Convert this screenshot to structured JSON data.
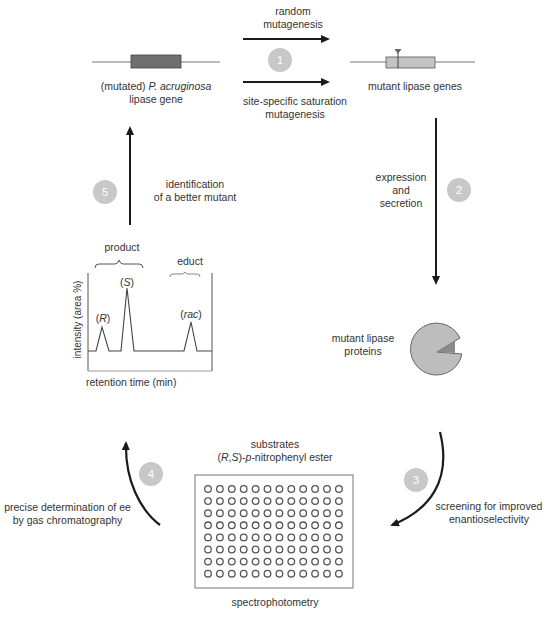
{
  "figure": {
    "type": "directed-evolution-cycle",
    "nodes": {
      "wildtype_gene": {
        "label_prefix": "(mutated) ",
        "label_species": "P. acruginosa",
        "label_line2": "lipase gene"
      },
      "mutant_genes": {
        "label": "mutant lipase genes"
      },
      "mutant_proteins": {
        "label_line1": "mutant lipase",
        "label_line2": "proteins"
      },
      "plate": {
        "title_line1": "substrates",
        "title_line2_parts": [
          "(",
          "R",
          ",",
          "S",
          ")-",
          "p",
          "-nitrophenyl ester"
        ],
        "caption": "spectrophotometry",
        "rows": 8,
        "cols": 12
      },
      "chromatogram": {
        "ylabel": "intensity (area %)",
        "xlabel": "retention time (min)",
        "group_product": "product",
        "group_educt": "educt",
        "peaks": [
          {
            "label": "R",
            "height": 0.35
          },
          {
            "label": "S",
            "height": 0.8
          },
          {
            "label": "rac",
            "height": 0.45
          }
        ]
      }
    },
    "steps": [
      {
        "number": "1",
        "label_top_line1": "random",
        "label_top_line2": "mutagenesis",
        "label_bottom_line1": "site-specific saturation",
        "label_bottom_line2": "mutagenesis"
      },
      {
        "number": "2",
        "label_line1": "expression",
        "label_line2": "and",
        "label_line3": "secretion"
      },
      {
        "number": "3",
        "label_line1": "screening for improved",
        "label_line2": "enantioselectivity"
      },
      {
        "number": "4",
        "label_line1": "precise determination of ee",
        "label_line2": "by gas chromatography"
      },
      {
        "number": "5",
        "label_line1": "identification",
        "label_line2": "of a better mutant"
      }
    ],
    "colors": {
      "arrow": "#1a1a1a",
      "step_circle": "#c8c8c8",
      "gene_box_dark": "#6e6e6e",
      "gene_box_light": "#c4c4c4",
      "protein_fill": "#bdbdbd",
      "well_stroke": "#555555"
    }
  }
}
